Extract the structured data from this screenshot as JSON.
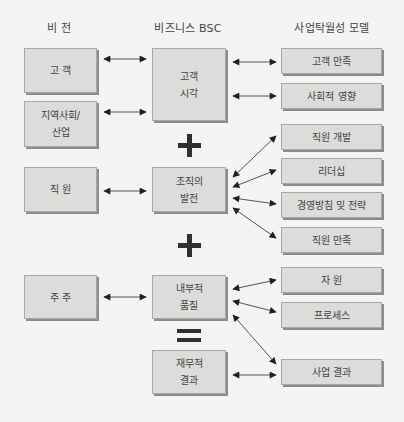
{
  "headers": {
    "vision": "비 전",
    "bsc": "비즈니스 BSC",
    "excellence": "사업탁월성 모델"
  },
  "vision": {
    "customer": [
      "고 객"
    ],
    "community": [
      "지역사회/",
      "산업"
    ],
    "employee": [
      "직 원"
    ],
    "shareholder": [
      "주 주"
    ]
  },
  "bsc": {
    "customer_view": [
      "고객",
      "시각"
    ],
    "org_growth": [
      "조직의",
      "발전"
    ],
    "internal_quality": [
      "내부적",
      "품질"
    ],
    "financial_result": [
      "재무적",
      "결과"
    ]
  },
  "excellence": {
    "customer_satisfaction": "고객 만족",
    "social_impact": "사회적 영향",
    "employee_development": "직원 개발",
    "leadership": "리더십",
    "policy_strategy": "경영방침 및 전략",
    "employee_satisfaction": "직원 만족",
    "resources": "자 원",
    "process": "프로세스",
    "business_results": "사업 결과"
  },
  "operators": [
    "+",
    "+",
    "="
  ],
  "colors": {
    "box_fill": "#dcdcdb",
    "box_border": "#a8a8a8",
    "box_shadow": "#8c8c8c",
    "arrow": "#222222",
    "background": "#f4f4f2"
  }
}
